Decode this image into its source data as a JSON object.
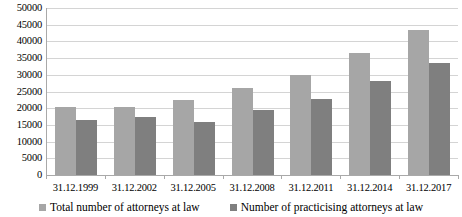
{
  "chart_data": {
    "type": "bar",
    "title": "",
    "subtitle": "",
    "xlabel": "",
    "ylabel": "",
    "ylim": [
      0,
      50000
    ],
    "ytick_step": 5000,
    "yticks": [
      "0",
      "5000",
      "10000",
      "15000",
      "20000",
      "25000",
      "30000",
      "35000",
      "40000",
      "45000",
      "50000"
    ],
    "grid": true,
    "legend_position": "bottom",
    "categories": [
      "31.12.1999",
      "31.12.2002",
      "31.12.2005",
      "31.12.2008",
      "31.12.2011",
      "31.12.2014",
      "31.12.2017"
    ],
    "series": [
      {
        "name": "Total number of attorneys at law",
        "color": "#a6a6a6",
        "values": [
          20400,
          20500,
          22400,
          26000,
          30000,
          36400,
          43300
        ]
      },
      {
        "name": "Number of practicising attorneys at law",
        "color": "#7f7f7f",
        "values": [
          16400,
          17300,
          15800,
          19500,
          22700,
          28000,
          33500
        ]
      }
    ]
  },
  "legend": {
    "items": [
      {
        "label": "Total number of attorneys at law"
      },
      {
        "label": "Number of practicising attorneys at law"
      }
    ]
  },
  "colors": {
    "series_a": "#a6a6a6",
    "series_b": "#7f7f7f",
    "gridline": "#d4d4d4",
    "axis": "#a9a9a9",
    "background": "#ffffff"
  }
}
